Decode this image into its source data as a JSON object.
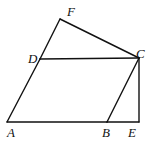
{
  "diagram": {
    "type": "geometry-figure",
    "stroke_color": "#111111",
    "background": "#ffffff",
    "points": {
      "A": {
        "label": "A",
        "x": 7,
        "y": 122,
        "lx": 8,
        "ly": 137
      },
      "B": {
        "label": "B",
        "x": 107,
        "y": 122,
        "lx": 102,
        "ly": 137
      },
      "E": {
        "label": "E",
        "x": 139,
        "y": 122,
        "lx": 128,
        "ly": 137
      },
      "C": {
        "label": "C",
        "x": 139,
        "y": 58,
        "lx": 139,
        "ly": 56
      },
      "D": {
        "label": "D",
        "x": 40,
        "y": 59,
        "lx": 28,
        "ly": 60
      },
      "F": {
        "label": "F",
        "x": 60,
        "y": 19,
        "lx": 67,
        "ly": 16
      }
    },
    "segments": [
      [
        "A",
        "B"
      ],
      [
        "B",
        "E"
      ],
      [
        "E",
        "C"
      ],
      [
        "C",
        "B"
      ],
      [
        "A",
        "D"
      ],
      [
        "D",
        "F"
      ],
      [
        "F",
        "C"
      ],
      [
        "D",
        "C"
      ]
    ]
  }
}
